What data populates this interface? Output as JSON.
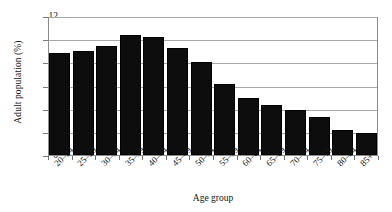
{
  "chart_data": {
    "type": "bar",
    "title": "",
    "xlabel": "Age group",
    "ylabel": "Adult population (%)",
    "categories": [
      "20–24",
      "25–29",
      "30–34",
      "35–39",
      "40–44",
      "45–49",
      "50–54",
      "55–59",
      "60–64",
      "65–69",
      "70–74",
      "75–79",
      "80–84",
      "85+"
    ],
    "values": [
      8.8,
      9.0,
      9.4,
      10.4,
      10.2,
      9.2,
      8.0,
      6.1,
      4.9,
      4.3,
      3.9,
      3.3,
      2.2,
      1.9
    ],
    "ylim": [
      0,
      12
    ],
    "yticks": [
      0,
      2,
      4,
      6,
      8,
      10,
      12
    ],
    "ytick_labels": [
      "0",
      "2",
      "4",
      "6",
      "8",
      "10",
      "12"
    ],
    "grid": "horizontal",
    "legend": "none",
    "bar_color": "#0d0d0d",
    "grid_color": "#a8a8a8",
    "axis_color": "#8d8d8d",
    "background": "#ffffff"
  }
}
